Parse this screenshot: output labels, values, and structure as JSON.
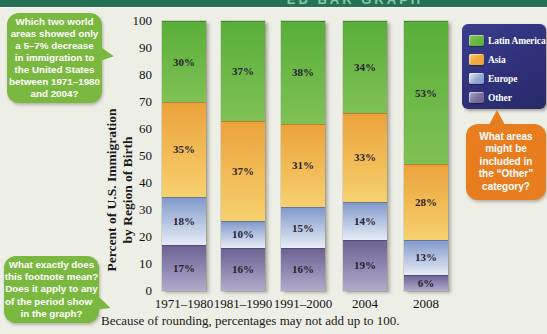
{
  "page": {
    "background": "#edeee6",
    "header": {
      "bar_color": "#257355",
      "title_fragment": "ED BAR GRAPH"
    }
  },
  "callouts": {
    "top_left": {
      "color": "#7ab840",
      "text": "Which two world\nareas showed only\na 5–7% decrease\nin immigration to\nthe United States\nbetween 1971–1980\nand 2004?"
    },
    "bottom_left": {
      "color": "#7ab840",
      "text": "What exactly does\nthis footnote mean?\nDoes it apply to any\nof the period shown\nin the graph?"
    },
    "other_category": {
      "color": "#e87d1f",
      "text": "What areas\nmight be\nincluded in\nthe “Other”\ncategory?"
    }
  },
  "chart_data": {
    "type": "bar",
    "stacked": true,
    "title": "",
    "ylabel": "Percent of U.S. Immigration\nby Region of Birth",
    "xlabel": "",
    "ylim": [
      0,
      100
    ],
    "yticks": [
      0,
      10,
      20,
      30,
      40,
      50,
      60,
      70,
      80,
      90,
      100
    ],
    "categories": [
      "1971–1980",
      "1981–1990",
      "1991–2000",
      "2004",
      "2008"
    ],
    "series": [
      {
        "name": "Latin America",
        "values": [
          30,
          37,
          38,
          34,
          53
        ],
        "color": "#6ab63f",
        "color_top": "#58ae38",
        "color_bottom": "#7fc156"
      },
      {
        "name": "Asia",
        "values": [
          35,
          37,
          31,
          33,
          28
        ],
        "color": "#f0a83c",
        "color_top": "#eca23b",
        "color_bottom": "#f6d16e"
      },
      {
        "name": "Europe",
        "values": [
          18,
          10,
          15,
          14,
          13
        ],
        "color": "#93a9d2",
        "color_top": "#7f98ca",
        "color_bottom": "#e7ecf6"
      },
      {
        "name": "Other",
        "values": [
          17,
          16,
          16,
          19,
          6
        ],
        "color": "#7a7099",
        "color_top": "#6b6193",
        "color_bottom": "#b2abcb"
      }
    ],
    "value_suffix": "%",
    "grid": false,
    "legend_position": "top-right",
    "legend_bg": "#2e3179",
    "footnote": "Because of rounding, percentages may not add up to 100."
  }
}
